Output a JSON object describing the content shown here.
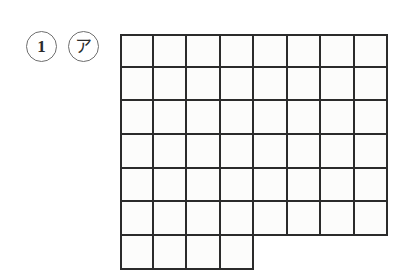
{
  "page": {
    "background_color": "#ffffff",
    "width": 413,
    "height": 277
  },
  "labels": {
    "question_number": {
      "text": "1",
      "shape": "circle",
      "name": "circled-number-1"
    },
    "sub_item": {
      "text": "ア",
      "shape": "circle",
      "name": "circled-kana-a"
    }
  },
  "figure": {
    "name": "step-shaped-square-grid",
    "type": "grid",
    "columns": 8,
    "rows": 7,
    "full_rows": 6,
    "last_row_columns": 4,
    "cell_width_px": 33.5,
    "cell_height_px": 33.7,
    "line_color": "#2b2b2b",
    "line_width_px": 2.6,
    "cell_fill_color": "#fcfcfb",
    "origin_x_px": 120,
    "origin_y_px": 34,
    "total_cells": 52,
    "row_cell_counts": [
      8,
      8,
      8,
      8,
      8,
      8,
      4
    ]
  }
}
